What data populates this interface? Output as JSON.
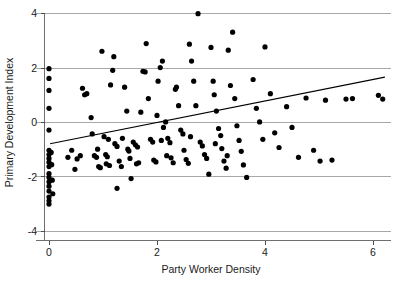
{
  "chart_data": {
    "type": "scatter",
    "title": "",
    "xlabel": "Party Worker Density",
    "ylabel": "Primary Development Index",
    "xlim": [
      -0.35,
      6.45
    ],
    "ylim": [
      -4.35,
      4.35
    ],
    "xticks": [
      0,
      2,
      4,
      6
    ],
    "xtick_labels": [
      "0",
      "2",
      "4",
      "6"
    ],
    "yticks": [
      -4,
      -2,
      0,
      2,
      4
    ],
    "ytick_labels": [
      "-4",
      "-2",
      "0",
      "2",
      "4"
    ],
    "grid": "horizontal",
    "gridlines_y": [
      -4,
      -2,
      0,
      2,
      4
    ],
    "legend": "none",
    "point_color": "#000000",
    "point_radius": 2.6,
    "line_color": "#000000",
    "fit_line": {
      "label": "linear regression fit",
      "x_start": 0.02,
      "y_start": -0.78,
      "x_end": 6.22,
      "y_end": 1.67,
      "slope": 0.395,
      "intercept": -0.788
    },
    "n_points": 140,
    "points": [
      [
        0.0,
        1.98
      ],
      [
        0.0,
        1.62
      ],
      [
        0.0,
        1.18
      ],
      [
        0.0,
        0.52
      ],
      [
        0.0,
        -0.28
      ],
      [
        0.0,
        -1.02
      ],
      [
        0.0,
        -1.18
      ],
      [
        0.0,
        -1.32
      ],
      [
        0.0,
        -1.46
      ],
      [
        0.0,
        -1.62
      ],
      [
        0.0,
        -1.88
      ],
      [
        0.0,
        -2.02
      ],
      [
        0.0,
        -2.18
      ],
      [
        0.0,
        -2.34
      ],
      [
        0.0,
        -2.52
      ],
      [
        0.0,
        -2.74
      ],
      [
        0.0,
        -2.88
      ],
      [
        0.0,
        -3.0
      ],
      [
        0.04,
        -1.1
      ],
      [
        0.05,
        -1.55
      ],
      [
        0.06,
        -2.12
      ],
      [
        0.07,
        -2.62
      ],
      [
        0.35,
        -1.28
      ],
      [
        0.42,
        -1.02
      ],
      [
        0.48,
        -1.72
      ],
      [
        0.62,
        1.26
      ],
      [
        0.66,
        1.02
      ],
      [
        0.7,
        1.06
      ],
      [
        0.78,
        0.18
      ],
      [
        0.8,
        -0.42
      ],
      [
        0.84,
        -1.22
      ],
      [
        0.88,
        -1.28
      ],
      [
        0.92,
        -1.62
      ],
      [
        0.95,
        -1.66
      ],
      [
        0.98,
        2.62
      ],
      [
        1.02,
        -0.52
      ],
      [
        1.05,
        -1.18
      ],
      [
        1.08,
        -1.26
      ],
      [
        1.1,
        -0.62
      ],
      [
        1.14,
        1.38
      ],
      [
        1.18,
        1.92
      ],
      [
        1.2,
        2.42
      ],
      [
        1.22,
        -0.78
      ],
      [
        1.26,
        -0.88
      ],
      [
        1.3,
        -1.42
      ],
      [
        1.34,
        -1.62
      ],
      [
        1.36,
        -0.58
      ],
      [
        1.4,
        1.3
      ],
      [
        1.44,
        0.42
      ],
      [
        1.46,
        -0.98
      ],
      [
        1.48,
        -1.05
      ],
      [
        1.5,
        -1.32
      ],
      [
        1.52,
        -2.06
      ],
      [
        1.26,
        -2.42
      ],
      [
        1.56,
        -0.72
      ],
      [
        1.6,
        -0.82
      ],
      [
        1.62,
        -1.52
      ],
      [
        1.66,
        -1.48
      ],
      [
        1.7,
        0.38
      ],
      [
        1.74,
        1.88
      ],
      [
        1.78,
        1.86
      ],
      [
        1.8,
        2.9
      ],
      [
        1.84,
        0.88
      ],
      [
        1.88,
        -0.62
      ],
      [
        1.92,
        -0.72
      ],
      [
        1.94,
        -1.38
      ],
      [
        1.98,
        -1.45
      ],
      [
        2.0,
        0.26
      ],
      [
        2.02,
        1.52
      ],
      [
        2.06,
        2.02
      ],
      [
        2.1,
        2.26
      ],
      [
        2.12,
        -0.18
      ],
      [
        2.16,
        0.02
      ],
      [
        2.2,
        -0.58
      ],
      [
        2.24,
        -0.74
      ],
      [
        2.26,
        -1.3
      ],
      [
        2.3,
        -1.48
      ],
      [
        2.34,
        1.22
      ],
      [
        2.36,
        1.3
      ],
      [
        2.4,
        0.62
      ],
      [
        2.44,
        -0.28
      ],
      [
        2.48,
        -0.42
      ],
      [
        2.5,
        -1.02
      ],
      [
        2.54,
        -1.36
      ],
      [
        2.58,
        -1.5
      ],
      [
        2.6,
        2.88
      ],
      [
        2.64,
        2.26
      ],
      [
        2.68,
        1.52
      ],
      [
        2.72,
        0.62
      ],
      [
        2.76,
        4.0
      ],
      [
        2.8,
        -0.72
      ],
      [
        2.84,
        -0.86
      ],
      [
        2.88,
        -1.18
      ],
      [
        2.92,
        -1.32
      ],
      [
        2.96,
        -1.9
      ],
      [
        3.0,
        2.76
      ],
      [
        3.04,
        1.52
      ],
      [
        3.06,
        1.02
      ],
      [
        3.1,
        0.42
      ],
      [
        3.14,
        -0.22
      ],
      [
        3.18,
        -0.48
      ],
      [
        3.2,
        -0.96
      ],
      [
        3.24,
        -1.42
      ],
      [
        3.28,
        -1.68
      ],
      [
        3.32,
        2.66
      ],
      [
        3.36,
        1.36
      ],
      [
        3.4,
        3.32
      ],
      [
        3.44,
        0.88
      ],
      [
        3.48,
        -0.12
      ],
      [
        3.52,
        -0.66
      ],
      [
        3.56,
        -1.06
      ],
      [
        3.6,
        -1.56
      ],
      [
        3.66,
        -2.02
      ],
      [
        3.78,
        1.58
      ],
      [
        3.84,
        0.52
      ],
      [
        3.9,
        0.02
      ],
      [
        3.96,
        -0.62
      ],
      [
        4.0,
        2.78
      ],
      [
        4.1,
        1.06
      ],
      [
        4.18,
        -0.38
      ],
      [
        4.26,
        -0.92
      ],
      [
        4.4,
        0.58
      ],
      [
        4.5,
        -0.18
      ],
      [
        4.62,
        -1.28
      ],
      [
        4.76,
        0.9
      ],
      [
        4.9,
        -1.02
      ],
      [
        5.02,
        -1.42
      ],
      [
        5.12,
        0.82
      ],
      [
        5.24,
        -1.38
      ],
      [
        5.5,
        0.86
      ],
      [
        5.62,
        0.88
      ],
      [
        6.1,
        1.0
      ],
      [
        6.18,
        0.86
      ],
      [
        0.52,
        -1.34
      ],
      [
        0.58,
        -1.22
      ],
      [
        1.06,
        -1.52
      ],
      [
        1.12,
        -1.58
      ],
      [
        2.08,
        -0.66
      ],
      [
        2.18,
        -1.22
      ],
      [
        3.08,
        -0.78
      ],
      [
        3.3,
        -1.22
      ],
      [
        1.64,
        -0.9
      ],
      [
        2.62,
        -0.52
      ],
      [
        0.9,
        -0.98
      ]
    ]
  }
}
